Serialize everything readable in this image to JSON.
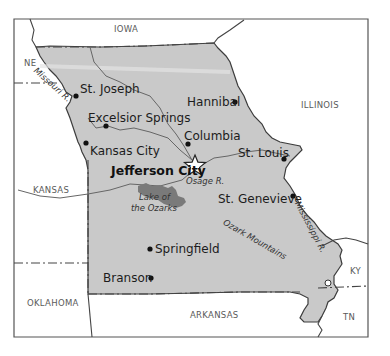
{
  "map": {
    "title": "Missouri",
    "colors": {
      "state_fill": "#c9c9c9",
      "lake_fill": "#7a7a7a",
      "border": "#444444",
      "background": "#ffffff"
    },
    "neighbor_states": [
      {
        "id": "iowa",
        "label": "IOWA"
      },
      {
        "id": "nebraska",
        "label": "NE"
      },
      {
        "id": "illinois",
        "label": "ILLINOIS"
      },
      {
        "id": "kansas",
        "label": "KANSAS"
      },
      {
        "id": "oklahoma",
        "label": "OKLAHOMA"
      },
      {
        "id": "arkansas",
        "label": "ARKANSAS"
      },
      {
        "id": "kentucky",
        "label": "KY"
      },
      {
        "id": "tennessee",
        "label": "TN"
      }
    ],
    "cities": [
      {
        "id": "st-joseph",
        "label": "St. Joseph"
      },
      {
        "id": "hannibal",
        "label": "Hannibal"
      },
      {
        "id": "excelsior-springs",
        "label": "Excelsior Springs"
      },
      {
        "id": "columbia",
        "label": "Columbia"
      },
      {
        "id": "kansas-city",
        "label": "Kansas City"
      },
      {
        "id": "st-louis",
        "label": "St. Louis"
      },
      {
        "id": "jefferson-city",
        "label": "Jefferson City",
        "capital": true
      },
      {
        "id": "st-genevieve",
        "label": "St. Genevieve"
      },
      {
        "id": "springfield",
        "label": "Springfield"
      },
      {
        "id": "branson",
        "label": "Branson"
      }
    ],
    "features": [
      {
        "id": "missouri-river",
        "label": "Missouri R."
      },
      {
        "id": "osage-river",
        "label": "Osage R."
      },
      {
        "id": "mississippi-river",
        "label": "Mississippi R."
      },
      {
        "id": "lake-of-the-ozarks",
        "label": "Lake of the Ozarks",
        "line1": "Lake of",
        "line2": "the Ozarks"
      },
      {
        "id": "ozark-mountains",
        "label": "Ozark Mountains"
      }
    ]
  }
}
